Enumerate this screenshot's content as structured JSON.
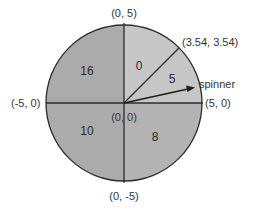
{
  "diagram": {
    "type": "spinner-circle",
    "center": {
      "x": 0,
      "y": 0
    },
    "radius": 5,
    "colors": {
      "dark_sector": "#ababab",
      "light_sector": "#c6c6c6",
      "stroke": "#2b2b2b",
      "text": "#333333"
    },
    "sectors": [
      {
        "id": "upper-left",
        "value": "16",
        "range_deg": [
          90,
          180
        ]
      },
      {
        "id": "upper-right-top",
        "value": "0",
        "range_deg": [
          45,
          90
        ]
      },
      {
        "id": "upper-right-bottom",
        "value": "5",
        "range_deg": [
          0,
          45
        ]
      },
      {
        "id": "lower-left",
        "value": "10",
        "range_deg": [
          180,
          270
        ]
      },
      {
        "id": "lower-right",
        "value": "8",
        "range_deg": [
          270,
          360
        ]
      }
    ],
    "point_labels": {
      "top": "(0, 5)",
      "bottom": "(0, -5)",
      "left": "(-5, 0)",
      "right": "(5, 0)",
      "diagonal": "(3.54, 3.54)",
      "center": "(0, 0)"
    },
    "spinner": {
      "label": "spinner",
      "angle_deg": 12
    }
  }
}
